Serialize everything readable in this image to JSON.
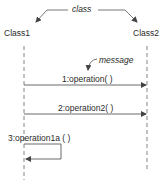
{
  "diagram": {
    "type": "uml-sequence",
    "annotations": {
      "class_label": "class",
      "message_label": "message"
    },
    "lifelines": [
      {
        "id": "class1",
        "label": "Class1",
        "x": 24
      },
      {
        "id": "class2",
        "label": "Class2",
        "x": 147
      }
    ],
    "messages": [
      {
        "seq": 1,
        "label": "1:operation( )",
        "from": "class1",
        "to": "class2",
        "y": 85
      },
      {
        "seq": 2,
        "label": "2:operation2( )",
        "from": "class1",
        "to": "class2",
        "y": 114
      },
      {
        "seq": 3,
        "label": "3:operation1a ( )",
        "from": "class1",
        "to": "class1",
        "self": true,
        "y_start": 144,
        "y_end": 159
      }
    ],
    "colors": {
      "line": "#555555",
      "text": "#2a2a2a"
    }
  }
}
